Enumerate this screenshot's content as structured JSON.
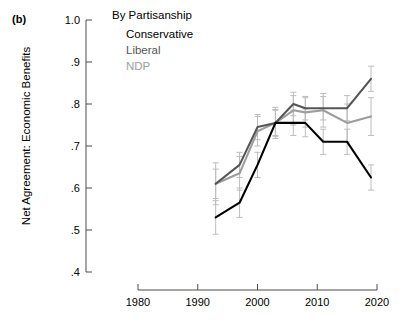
{
  "panel": {
    "label": "(b)"
  },
  "legend": {
    "title": "By Partisanship",
    "entries": [
      {
        "label": "Conservative",
        "color": "#000000"
      },
      {
        "label": "Liberal",
        "color": "#555555"
      },
      {
        "label": "NDP",
        "color": "#9d9d9d"
      }
    ]
  },
  "axes": {
    "ylabel": "Net Agreement: Economic Benefits",
    "xlabel": "",
    "yticks": [
      "1.0",
      ".9",
      ".8",
      ".7",
      ".6",
      ".5",
      ".4"
    ],
    "ytick_values": [
      1.0,
      0.9,
      0.8,
      0.7,
      0.6,
      0.5,
      0.4
    ],
    "xticks": [
      "1980",
      "1990",
      "2000",
      "2010",
      "2020"
    ],
    "xtick_values": [
      1980,
      1990,
      2000,
      2010,
      2020
    ]
  },
  "chart_data": {
    "type": "line",
    "title": "By Partisanship",
    "xlabel": "",
    "ylabel": "Net Agreement: Economic Benefits",
    "xlim": [
      1980,
      2020
    ],
    "ylim": [
      0.4,
      1.0
    ],
    "grid": false,
    "legend_position": "top-center",
    "error_bars": true,
    "x": [
      1993,
      1997,
      2000,
      2003,
      2006,
      2008,
      2011,
      2015,
      2019
    ],
    "series": [
      {
        "name": "Conservative",
        "color": "#000000",
        "values": [
          0.53,
          0.565,
          0.655,
          0.755,
          0.755,
          0.755,
          0.71,
          0.71,
          0.625
        ],
        "err_low": [
          0.49,
          0.53,
          0.625,
          0.725,
          0.725,
          0.722,
          0.68,
          0.68,
          0.595
        ],
        "err_high": [
          0.57,
          0.6,
          0.685,
          0.785,
          0.785,
          0.788,
          0.74,
          0.74,
          0.655
        ]
      },
      {
        "name": "Liberal",
        "color": "#555555",
        "values": [
          0.61,
          0.655,
          0.745,
          0.755,
          0.8,
          0.79,
          0.79,
          0.79,
          0.86
        ],
        "err_low": [
          0.575,
          0.625,
          0.715,
          0.723,
          0.772,
          0.762,
          0.762,
          0.76,
          0.83
        ],
        "err_high": [
          0.645,
          0.685,
          0.775,
          0.787,
          0.828,
          0.818,
          0.818,
          0.82,
          0.89
        ]
      },
      {
        "name": "NDP",
        "color": "#9d9d9d",
        "values": [
          0.61,
          0.635,
          0.735,
          0.755,
          0.785,
          0.78,
          0.785,
          0.755,
          0.77
        ],
        "err_low": [
          0.56,
          0.595,
          0.7,
          0.718,
          0.75,
          0.745,
          0.745,
          0.71,
          0.725
        ],
        "err_high": [
          0.66,
          0.675,
          0.77,
          0.792,
          0.82,
          0.815,
          0.825,
          0.8,
          0.815
        ]
      }
    ]
  }
}
